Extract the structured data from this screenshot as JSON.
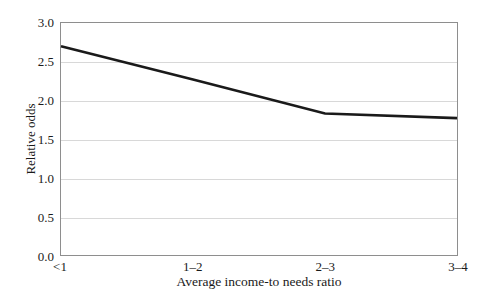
{
  "chart_data": {
    "type": "line",
    "title": "",
    "xlabel": "Average income-to needs ratio",
    "ylabel": "Relative odds",
    "categories": [
      "<1",
      "1–2",
      "2–3",
      "3–4"
    ],
    "values": [
      2.7,
      2.27,
      1.83,
      1.77
    ],
    "series": [
      {
        "name": "Relative odds",
        "values": [
          2.7,
          2.27,
          1.83,
          1.77
        ],
        "color": "#1a1a1a"
      }
    ],
    "ylim": [
      0.0,
      3.0
    ],
    "yticks": [
      "0.0",
      "0.5",
      "1.0",
      "1.5",
      "2.0",
      "2.5",
      "3.0"
    ],
    "ytick_values": [
      0.0,
      0.5,
      1.0,
      1.5,
      2.0,
      2.5,
      3.0
    ],
    "grid": "horizontal",
    "gridcolor": "#d8d8d8",
    "legend": "none",
    "frame_color": "#8e8e8e",
    "background": "#ffffff",
    "line_width_px": 2.6
  }
}
